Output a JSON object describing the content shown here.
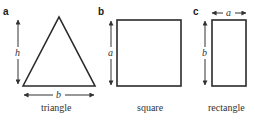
{
  "panels": [
    {
      "letter": "a",
      "shape": "triangle",
      "caption": "triangle",
      "dimensions": {
        "height_label": "h",
        "base_label": "b"
      }
    },
    {
      "letter": "b",
      "shape": "square",
      "caption": "square",
      "dimensions": {
        "side_label": "a"
      }
    },
    {
      "letter": "c",
      "shape": "rectangle",
      "caption": "rectangle",
      "dimensions": {
        "width_label": "a",
        "height_label": "b"
      }
    }
  ],
  "colors": {
    "stroke": "#2a2a2a",
    "arrow": "#333333",
    "background": "#ffffff"
  }
}
